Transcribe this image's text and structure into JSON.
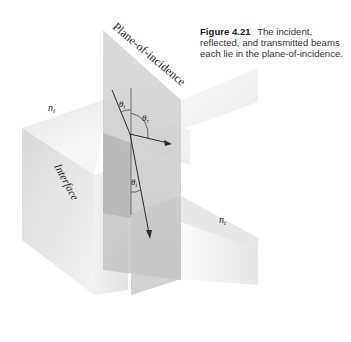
{
  "caption": {
    "figure_number": "Figure 4.21",
    "text": "The incident, reflected, and transmitted beams each lie in the plane-of-incidence."
  },
  "labels": {
    "plane": "Plane-of-incidence",
    "interface": "Interface",
    "n_incident": "n",
    "n_incident_sub": "i",
    "n_transmitted": "n",
    "n_transmitted_sub": "t",
    "theta_i": "θ",
    "theta_i_sub": "i",
    "theta_r": "θ",
    "theta_r_sub": "r",
    "theta_t": "θ",
    "theta_t_sub": "t"
  },
  "colors": {
    "background": "#ffffff",
    "plane_fill": "#c8c8c8",
    "block_light": "#f2f2f2",
    "block_mid": "#dddddd",
    "block_dark": "#b8b8b8",
    "ray": "#2a2a2a"
  }
}
